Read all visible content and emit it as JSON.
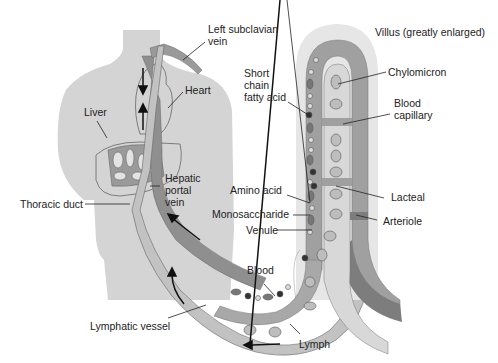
{
  "title": "Villus (greatly enlarged)",
  "colors": {
    "body": "#d4d4d4",
    "vein_dark": "#8f8f8f",
    "artery_dark": "#7d7d7d",
    "lymph_light": "#c2c2c2",
    "villus_outer": "#e6e6e6",
    "blood_vessel": "#a8a8a8",
    "lacteal": "#d8d8d8",
    "outline": "#555555",
    "label_text": "#222222"
  },
  "labels": {
    "left_subclavian_vein": "Left subclavian\nvein",
    "heart": "Heart",
    "liver": "Liver",
    "hepatic_portal_vein": "Hepatic\nportal\nvein",
    "thoracic_duct": "Thoracic duct",
    "lymphatic_vessel": "Lymphatic vessel",
    "villus": "Villus (greatly enlarged)",
    "short_chain_fatty_acid": "Short\nchain\nfatty acid",
    "chylomicron": "Chylomicron",
    "blood_capillary": "Blood\ncapillary",
    "amino_acid": "Amino acid",
    "monosaccharide": "Monosaccharide",
    "venule": "Venule",
    "lacteal": "Lacteal",
    "arteriole": "Arteriole",
    "blood": "Blood",
    "lymph": "Lymph"
  }
}
